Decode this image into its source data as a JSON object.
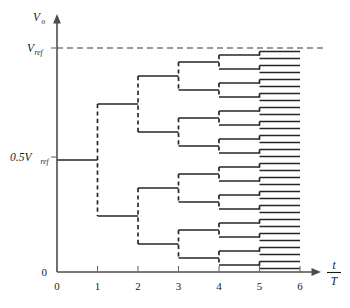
{
  "figure": {
    "background_color": "#ffffff",
    "trace_color": "#262626",
    "axis_color": "#4d4d4d"
  },
  "axes": {
    "y": {
      "name": "V",
      "name_subscript": "o",
      "labels": {
        "vref": "V",
        "vref_subscript": "ref",
        "half_vref": "0.5V",
        "half_vref_subscript": "ref",
        "zero": "0"
      }
    },
    "x": {
      "name_numerator": "t",
      "name_denominator": "T",
      "ticks": [
        "0",
        "1",
        "2",
        "3",
        "4",
        "5",
        "6"
      ],
      "range": [
        0,
        6
      ]
    }
  },
  "chart_data": {
    "type": "line",
    "xlabel": "t/T",
    "ylabel": "Vo",
    "xlim": [
      0,
      6
    ],
    "ylim": [
      0,
      1
    ],
    "grid": false,
    "legend": null,
    "y_reference_levels": [
      {
        "label": "Vref",
        "value": 1.0,
        "style": "dashed"
      },
      {
        "label": "0.5Vref",
        "value": 0.5,
        "style": "solid-tick"
      },
      {
        "label": "0",
        "value": 0.0,
        "style": "axis"
      }
    ],
    "tree": {
      "start_value": 0.5,
      "start_period": [
        0,
        1
      ],
      "levels": 5,
      "branching": 2,
      "step_ratio": 0.5
    },
    "series": [
      {
        "name": "period-1",
        "x_span": [
          0,
          1
        ],
        "values": [
          0.5
        ]
      },
      {
        "name": "period-2",
        "x_span": [
          1,
          2
        ],
        "values": [
          0.75,
          0.25
        ]
      },
      {
        "name": "period-3",
        "x_span": [
          2,
          3
        ],
        "values": [
          0.875,
          0.625,
          0.375,
          0.125
        ]
      },
      {
        "name": "period-4",
        "x_span": [
          3,
          4
        ],
        "values": [
          0.9375,
          0.8125,
          0.6875,
          0.5625,
          0.4375,
          0.3125,
          0.1875,
          0.0625
        ]
      },
      {
        "name": "period-5",
        "x_span": [
          4,
          5
        ],
        "values": [
          0.96875,
          0.90625,
          0.84375,
          0.78125,
          0.71875,
          0.65625,
          0.59375,
          0.53125,
          0.46875,
          0.40625,
          0.34375,
          0.28125,
          0.21875,
          0.15625,
          0.09375,
          0.03125
        ]
      },
      {
        "name": "period-6",
        "x_span": [
          5,
          6
        ],
        "values": [
          0.984375,
          0.953125,
          0.921875,
          0.890625,
          0.859375,
          0.828125,
          0.796875,
          0.765625,
          0.734375,
          0.703125,
          0.671875,
          0.640625,
          0.609375,
          0.578125,
          0.546875,
          0.515625,
          0.484375,
          0.453125,
          0.421875,
          0.390625,
          0.359375,
          0.328125,
          0.296875,
          0.265625,
          0.234375,
          0.203125,
          0.171875,
          0.140625,
          0.109375,
          0.078125,
          0.046875,
          0.015625
        ]
      }
    ]
  },
  "geometry": {
    "x_origin_px": 57,
    "x_unit_px": 40.5,
    "y_zero_px": 272,
    "y_vref_px": 48,
    "plot_top_px": 14
  }
}
